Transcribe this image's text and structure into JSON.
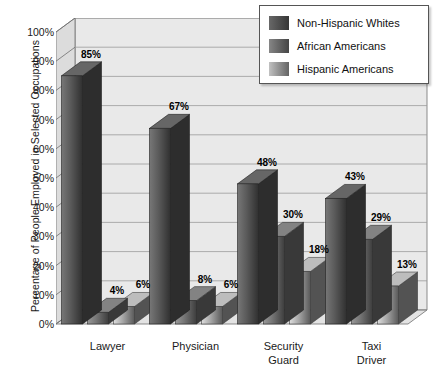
{
  "chart_data": {
    "type": "bar",
    "title": "",
    "subtitle": "",
    "xlabel": "",
    "ylabel": "Percentage of People Employed in Selected Occupations",
    "ylim": [
      0,
      100
    ],
    "ytick_labels": [
      "0%",
      "10%",
      "20%",
      "30%",
      "40%",
      "50%",
      "60%",
      "70%",
      "80%",
      "90%",
      "100%"
    ],
    "ytick_values": [
      0,
      10,
      20,
      30,
      40,
      50,
      60,
      70,
      80,
      90,
      100
    ],
    "grid": true,
    "legend_position": "top-right",
    "categories": [
      "Lawyer",
      "Physician",
      "Security\nGuard",
      "Taxi\nDriver"
    ],
    "category_lines": [
      [
        "Lawyer"
      ],
      [
        "Physician"
      ],
      [
        "Security",
        "Guard"
      ],
      [
        "Taxi",
        "Driver"
      ]
    ],
    "series": [
      {
        "name": "Non-Hispanic Whites",
        "color": "#4d4d4d",
        "values": [
          85,
          67,
          48,
          43
        ],
        "labels": [
          "85%",
          "67%",
          "48%",
          "43%"
        ]
      },
      {
        "name": "African Americans",
        "color": "#636363",
        "values": [
          4,
          8,
          30,
          29
        ],
        "labels": [
          "4%",
          "8%",
          "30%",
          "29%"
        ]
      },
      {
        "name": "Hispanic Americans",
        "color": "#8f8f8f",
        "values": [
          6,
          6,
          18,
          13
        ],
        "labels": [
          "6%",
          "6%",
          "18%",
          "13%"
        ]
      }
    ]
  },
  "legend": {
    "items": [
      {
        "label": "Non-Hispanic Whites",
        "swatch": "#4d4d4d"
      },
      {
        "label": "African Americans",
        "swatch": "#636363"
      },
      {
        "label": "Hispanic Americans",
        "swatch": "#8f8f8f"
      }
    ]
  },
  "colors": {
    "plot_background": "#e9e9e9",
    "wall_shade": "#dcdcdc",
    "floor": "#e3e3e3",
    "gridline": "#9a9a9a",
    "axis": "#6e6e6e",
    "text": "#1a1a1a"
  }
}
